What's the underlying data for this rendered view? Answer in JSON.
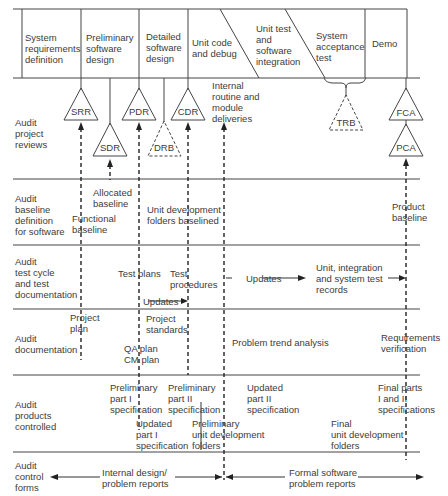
{
  "phases": [
    {
      "label": "System\nrequirements\ndefinition"
    },
    {
      "label": "Preliminary\nsoftware\ndesign"
    },
    {
      "label": "Detailed\nsoftware\ndesign"
    },
    {
      "label": "Unit code\nand debug"
    },
    {
      "label": "Unit test\nand\nsoftware\nintegration"
    },
    {
      "label": "System\nacceptance\ntest"
    },
    {
      "label": "Demo"
    }
  ],
  "rows": [
    {
      "label": "Audit\nproject\nreviews"
    },
    {
      "label": "Audit\nbaseline\ndefinition\nfor software"
    },
    {
      "label": "Audit\ntest cycle\nand test\ndocumentation"
    },
    {
      "label": "Audit\ndocumentation"
    },
    {
      "label": "Audit\nproducts\ncontrolled"
    },
    {
      "label": "Audit\ncontrol\nforms"
    }
  ],
  "reviews": {
    "srr": "SRR",
    "sdr": "SDR",
    "pdr": "PDR",
    "drb": "DRB",
    "cdr": "CDR",
    "trb": "TRB",
    "fca": "FCA",
    "pca": "PCA"
  },
  "annotations": {
    "internal_deliveries": "Internal\nroutine and\nmodule\ndeliveries",
    "allocated_baseline": "Allocated\nbaseline",
    "functional_baseline": "Functional\nbaseline",
    "unit_dev_folders_baselined": "Unit development\nfolders baselined",
    "product_baseline": "Product\nbaseline",
    "test_plans": "Test plans",
    "test_procedures": "Test\nprocedures",
    "updates_1": "Updates",
    "updates_2": "Updates",
    "test_records": "Unit, integration\nand system test\nrecords",
    "project_plan": "Project\nplan",
    "project_standards": "Project\nstandards",
    "qa_cm_plan": "QA plan\nCM plan",
    "problem_trend": "Problem trend analysis",
    "req_verification": "Requirements\nverification",
    "prelim_part1": "Preliminary\npart I\nspecification",
    "prelim_part2": "Preliminary\npart II\nspecification",
    "updated_part1": "Updated\npart I\nspecification",
    "prelim_udf": "Preliminary\nunit development\nfolders",
    "updated_part2": "Updated\npart II\nspecification",
    "final_udf": "Final\nunit development\nfolders",
    "final_parts": "Final parts\nI and II\nspecifications",
    "internal_reports": "Internal design/\nproblem reports",
    "formal_reports": "Formal software\nproblem reports"
  }
}
